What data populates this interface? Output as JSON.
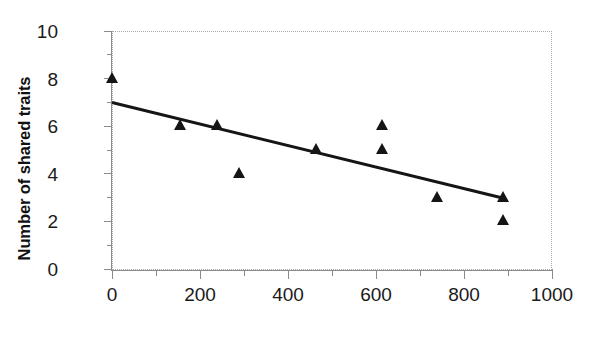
{
  "chart_data": {
    "type": "scatter",
    "title": "",
    "xlabel": "",
    "ylabel": "Number of shared traits",
    "xlim": [
      0,
      1000
    ],
    "ylim": [
      0,
      10
    ],
    "x_major_ticks": [
      0,
      200,
      400,
      600,
      800,
      1000
    ],
    "x_minor_ticks": [
      100,
      300,
      500,
      700,
      900
    ],
    "y_major_ticks": [
      0,
      2,
      4,
      6,
      8,
      10
    ],
    "y_minor_ticks": [
      1,
      3,
      5,
      7,
      9
    ],
    "x_tick_labels": [
      "0",
      "200",
      "400",
      "600",
      "800",
      "1000"
    ],
    "y_tick_labels": [
      "0",
      "2",
      "4",
      "6",
      "8",
      "10"
    ],
    "grid": false,
    "legend": "none",
    "marker_style": "triangle",
    "marker_color": "#151515",
    "points": [
      {
        "x": 0,
        "y": 8
      },
      {
        "x": 155,
        "y": 6
      },
      {
        "x": 240,
        "y": 6
      },
      {
        "x": 290,
        "y": 4
      },
      {
        "x": 465,
        "y": 5
      },
      {
        "x": 615,
        "y": 6
      },
      {
        "x": 615,
        "y": 5
      },
      {
        "x": 740,
        "y": 3
      },
      {
        "x": 890,
        "y": 3
      },
      {
        "x": 890,
        "y": 2
      }
    ],
    "series": [
      {
        "name": "shared traits",
        "x": [
          0,
          155,
          240,
          290,
          465,
          615,
          615,
          740,
          890,
          890
        ],
        "values": [
          8,
          6,
          6,
          4,
          5,
          6,
          5,
          3,
          3,
          2
        ]
      }
    ],
    "trendline": {
      "type": "line",
      "color": "#151515",
      "x_start": 0,
      "y_start": 7.0,
      "x_end": 885,
      "y_end": 3.0
    }
  }
}
